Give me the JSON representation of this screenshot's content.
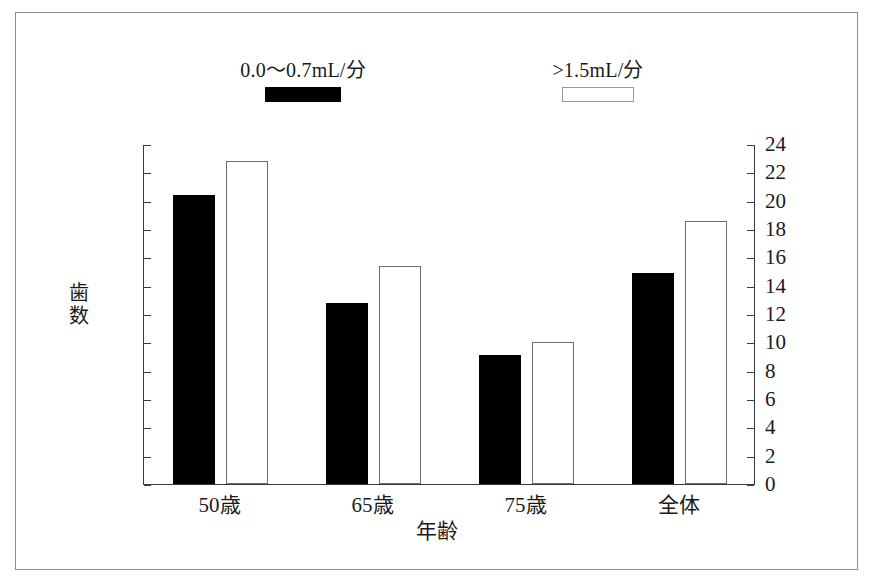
{
  "chart_data": {
    "type": "bar",
    "title": "",
    "xlabel": "年齢",
    "ylabel": "歯数",
    "categories": [
      "50歳",
      "65歳",
      "75歳",
      "全体"
    ],
    "series": [
      {
        "name": "0.0〜0.7mL/分",
        "color": "#000000",
        "values": [
          20.4,
          12.8,
          9.1,
          14.9
        ]
      },
      {
        "name": ">1.5mL/分",
        "color": "#ffffff",
        "values": [
          22.8,
          15.4,
          10.0,
          18.6
        ]
      }
    ],
    "ylim": [
      0,
      24
    ],
    "ytick_step": 2,
    "yticks": [
      0,
      2,
      4,
      6,
      8,
      10,
      12,
      14,
      16,
      18,
      20,
      22,
      24
    ],
    "ytick_labels_left": [
      "0",
      "2",
      "4",
      "6",
      "8",
      "10",
      "12",
      "14",
      "16",
      "18",
      "20",
      "22",
      "24"
    ],
    "ytick_labels_right": [
      "0",
      "2",
      "4",
      "6",
      "8",
      "10",
      "12",
      "14",
      "16",
      "18",
      "20",
      "22",
      "24"
    ],
    "grid": false,
    "legend_position": "top",
    "dual_axis": true,
    "frame_color": "#3a3a3a",
    "background": "#ffffff"
  },
  "legend": [
    {
      "label": "0.0〜0.7mL/分",
      "swatch": "filled-black-square"
    },
    {
      "label": ">1.5mL/分",
      "swatch": "outlined-white-square"
    }
  ],
  "y_axis_title_chars": [
    "歯",
    "数"
  ]
}
